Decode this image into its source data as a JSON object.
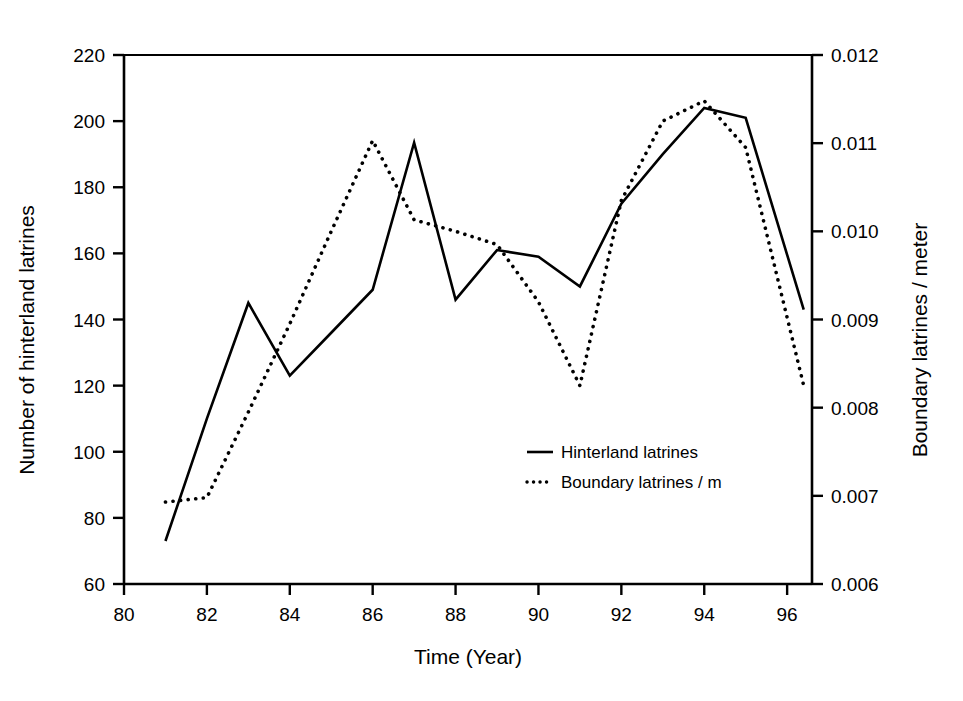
{
  "chart_data": {
    "type": "line",
    "title": "",
    "xlabel": "Time (Year)",
    "ylabel": "Number of hinterland latrines",
    "y2label": "Boundary latrines / meter",
    "grid": false,
    "legend_position": "center-right",
    "xlim": [
      80,
      96.6
    ],
    "ylim": [
      60,
      220
    ],
    "y2lim": [
      0.006,
      0.012
    ],
    "x_ticks": [
      "80",
      "82",
      "84",
      "86",
      "88",
      "90",
      "92",
      "94",
      "96"
    ],
    "x_tick_values": [
      80,
      82,
      84,
      86,
      88,
      90,
      92,
      94,
      96
    ],
    "y_ticks": [
      "60",
      "80",
      "100",
      "120",
      "140",
      "160",
      "180",
      "200",
      "220"
    ],
    "y_tick_values": [
      60,
      80,
      100,
      120,
      140,
      160,
      180,
      200,
      220
    ],
    "y2_ticks": [
      "0.006",
      "0.007",
      "0.008",
      "0.009",
      "0.010",
      "0.011",
      "0.012"
    ],
    "y2_tick_values": [
      0.006,
      0.007,
      0.008,
      0.009,
      0.01,
      0.011,
      0.012
    ],
    "x": [
      81,
      82,
      83,
      84,
      85,
      86,
      87,
      88,
      89,
      90,
      91,
      92,
      93,
      94,
      95,
      96.4
    ],
    "series": [
      {
        "name": "Hinterland latrines",
        "axis": "left",
        "style": "solid",
        "color": "#000000",
        "values": [
          73,
          110,
          145,
          123,
          136,
          149,
          193.5,
          146,
          161,
          159,
          150,
          175,
          190,
          204,
          201,
          143
        ]
      },
      {
        "name": "Boundary latrines / m",
        "axis": "right",
        "style": "dotted",
        "color": "#000000",
        "values": [
          0.00693,
          0.00698,
          0.00795,
          0.00895,
          0.01,
          0.01103,
          0.01013,
          0.01,
          0.00985,
          0.0092,
          0.00825,
          0.01035,
          0.01125,
          0.01148,
          0.01095,
          0.00825
        ]
      }
    ],
    "legend": [
      {
        "label": "Hinterland latrines",
        "style": "solid"
      },
      {
        "label": "Boundary latrines / m",
        "style": "dotted"
      }
    ]
  }
}
